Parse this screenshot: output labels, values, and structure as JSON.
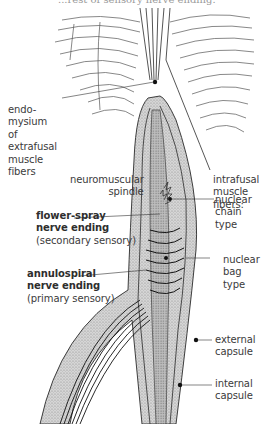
{
  "header": {
    "cut_off_text": "...rest of sensory nerve ending."
  },
  "labels": {
    "endomysium": [
      "endo-",
      "mysium",
      "of",
      "extrafusal",
      "muscle",
      "fibers"
    ],
    "neuromuscular_spindle": [
      "neuromuscular",
      "spindle"
    ],
    "intrafusal": [
      "intrafusal",
      "muscle",
      "fibers:"
    ],
    "nuclear_chain": [
      "nuclear",
      "chain",
      "type"
    ],
    "flower_spray": {
      "title": [
        "flower-spray",
        "nerve ending"
      ],
      "subtitle": "(secondary sensory)"
    },
    "annulospiral": {
      "title": [
        "annulospiral",
        "nerve ending"
      ],
      "subtitle": "(primary sensory)"
    },
    "nuclear_bag": [
      "nuclear",
      "bag",
      "type"
    ],
    "external_capsule": [
      "external",
      "capsule"
    ],
    "internal_capsule": [
      "internal",
      "capsule"
    ]
  },
  "colors": {
    "line": "#2a2a2a",
    "stipple": "#b8b8b8",
    "capsule_fill": "#cfcfcf",
    "text": "#3b3b3b"
  }
}
